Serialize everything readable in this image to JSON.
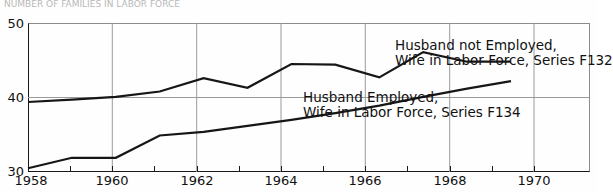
{
  "title_faint": "NUMBER OF FAMILIES IN LABOR FORCE",
  "axis": {
    "y_ticks": [
      "30",
      "40",
      "50"
    ],
    "x_ticks": [
      "1958",
      "1960",
      "1962",
      "1964",
      "1966",
      "1968",
      "1970"
    ]
  },
  "annotations": {
    "f132": {
      "line1": "Husband not Employed,",
      "line2": "Wife in Labor Force, Series F132"
    },
    "f134": {
      "line1": "Husband Employed,",
      "line2": "Wife in Labor Force, Series F134"
    }
  },
  "colors": {
    "line": "#161616",
    "grid": "#9a9a9a",
    "axis": "#1a1a1a",
    "text": "#111111"
  },
  "chart_data": {
    "type": "line",
    "title": "",
    "xlabel": "",
    "ylabel": "",
    "xlim": [
      1958,
      1970.8
    ],
    "ylim": [
      30,
      50
    ],
    "grid": true,
    "grid_x_values": [
      1960,
      1962,
      1964,
      1966,
      1968,
      1970
    ],
    "grid_y_values": [
      40
    ],
    "legend_position": "inline-annotations",
    "x": [
      1958,
      1959,
      1960,
      1961,
      1962,
      1963,
      1964,
      1965,
      1966,
      1967,
      1968,
      1969
    ],
    "series": [
      {
        "name": "Husband not Employed, Wife in Labor Force, Series F132",
        "values": [
          39.4,
          39.7,
          40.1,
          40.8,
          42.6,
          41.3,
          44.5,
          44.4,
          42.7,
          46.1,
          44.8,
          44.8
        ]
      },
      {
        "name": "Husband Employed, Wife in Labor Force, Series F134",
        "values": [
          30.5,
          31.9,
          31.9,
          34.9,
          35.4,
          36.2,
          37.0,
          37.9,
          38.9,
          40.1,
          41.2,
          42.2
        ]
      }
    ]
  }
}
